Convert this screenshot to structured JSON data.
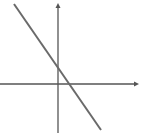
{
  "figure": {
    "type": "coordinate-plane",
    "colors": {
      "background": "#ffffff",
      "axis": "#555555",
      "line": "#6a6a6a"
    },
    "x_axis": {
      "y": 84,
      "x_start": 0,
      "x_end": 139,
      "arrow": "right"
    },
    "y_axis": {
      "x": 58,
      "y_start": 133,
      "y_end": 3,
      "arrow": "up"
    },
    "line": {
      "x1": 14,
      "y1": 4,
      "x2": 101,
      "y2": 130,
      "slope": "negative",
      "y_intercept": "positive",
      "x_intercept": "positive"
    }
  },
  "chart_data": {
    "type": "line",
    "title": "",
    "xlabel": "",
    "ylabel": "",
    "grid": false,
    "series": [
      {
        "name": "line",
        "description": "decreasing linear function crossing positive y-axis and positive x-axis"
      }
    ]
  }
}
